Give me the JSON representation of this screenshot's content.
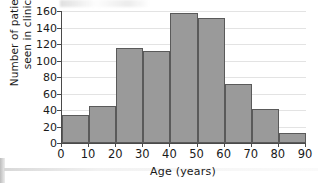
{
  "chart_data": {
    "type": "bar",
    "title": "",
    "subtitle": "",
    "xlabel": "Age (years)",
    "ylabel": "Number of patients seen in clinic",
    "ylabel_line1": "Number of patients",
    "ylabel_line2": "seen in clinic",
    "xlim": [
      0,
      90
    ],
    "ylim": [
      0,
      160
    ],
    "bin_width": 10,
    "grid": true,
    "legend": null,
    "bar_color": "#9a9a9a",
    "bar_edge_color": "#5a5a5a",
    "axis_color": "#4a4a4a",
    "gridline_color": "#e3e3e3",
    "background_color": "#ffffff",
    "categories": [
      "0-10",
      "10-20",
      "20-30",
      "30-40",
      "40-50",
      "50-60",
      "60-70",
      "70-80",
      "80-90"
    ],
    "bin_edges": [
      0,
      10,
      20,
      30,
      40,
      50,
      60,
      70,
      80,
      90
    ],
    "values": [
      34,
      45,
      115,
      111,
      158,
      151,
      72,
      41,
      12
    ],
    "yticks": [
      0,
      20,
      40,
      60,
      80,
      100,
      120,
      140,
      160
    ],
    "ytick_labels": [
      "0",
      "20",
      "40",
      "60",
      "80",
      "100",
      "120",
      "140",
      "160"
    ],
    "xticks": [
      0,
      10,
      20,
      30,
      40,
      50,
      60,
      70,
      80,
      90
    ],
    "xtick_labels": [
      "0",
      "10",
      "20",
      "30",
      "40",
      "50",
      "60",
      "70",
      "80",
      "90"
    ]
  }
}
